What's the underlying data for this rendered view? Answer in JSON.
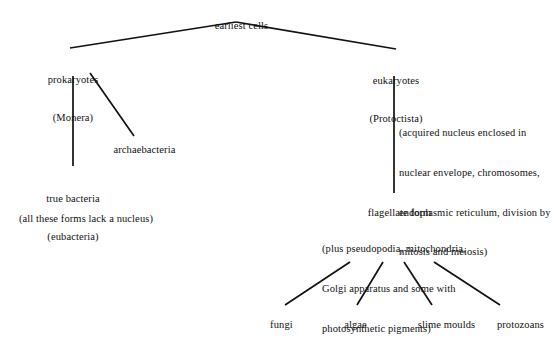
{
  "diagram": {
    "background_color": "#ffffff",
    "line_color": "#111111",
    "text_color": "#111111",
    "nodes": {
      "earliest_cells": "earliest cells",
      "prokaryotes_line1": "prokaryotes",
      "prokaryotes_line2": "(Monera)",
      "eukaryotes_line1": "eukaryotes",
      "eukaryotes_line2": "(Protoctista)",
      "archaebacteria": "archaebacteria",
      "true_bacteria_line1": "true bacteria",
      "true_bacteria_line2": "(eubacteria)",
      "flagellate_form": "flagellate form",
      "fungi": "fungi",
      "algae": "algae",
      "slime_moulds": "slime moulds",
      "protozoans": "protozoans"
    },
    "annotations": {
      "prokaryote_note": "(all these forms lack a nucleus)",
      "eukaryote_note_line1": "(acquired nucleus enclosed in",
      "eukaryote_note_line2": "nuclear envelope, chromosomes,",
      "eukaryote_note_line3": "endoplasmic reticulum, division by",
      "eukaryote_note_line4": "mitosis and meiosis)",
      "flagellate_note_line1": "(plus pseudopodia, mitochondria,",
      "flagellate_note_line2": "Golgi apparatus and some with",
      "flagellate_note_line3": "photosynthetic pigments)"
    },
    "edges": [
      {
        "name": "earliest-cells-to-prokaryotes",
        "x1": 236,
        "y1": 22,
        "x2": 70,
        "y2": 48
      },
      {
        "name": "earliest-cells-to-eukaryotes",
        "x1": 236,
        "y1": 22,
        "x2": 396,
        "y2": 49
      },
      {
        "name": "prokaryotes-to-true-bacteria",
        "x1": 73,
        "y1": 76,
        "x2": 73,
        "y2": 166
      },
      {
        "name": "prokaryotes-to-archaebacteria",
        "x1": 90,
        "y1": 73,
        "x2": 134,
        "y2": 136
      },
      {
        "name": "eukaryotes-to-flagellate-form",
        "x1": 394,
        "y1": 76,
        "x2": 394,
        "y2": 193
      },
      {
        "name": "flagellate-form-to-fungi",
        "x1": 350,
        "y1": 262,
        "x2": 285,
        "y2": 305
      },
      {
        "name": "flagellate-form-to-algae",
        "x1": 383,
        "y1": 262,
        "x2": 357,
        "y2": 305
      },
      {
        "name": "flagellate-form-to-slime-moulds",
        "x1": 404,
        "y1": 262,
        "x2": 432,
        "y2": 305
      },
      {
        "name": "flagellate-form-to-protozoans",
        "x1": 434,
        "y1": 262,
        "x2": 500,
        "y2": 305
      }
    ]
  }
}
